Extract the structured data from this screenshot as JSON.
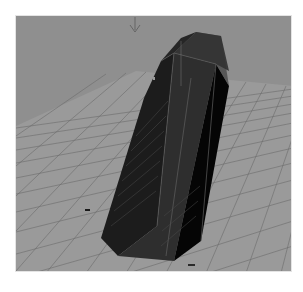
{
  "viewport": {
    "type": "3d-perspective-viewport",
    "background_color": "#8f8f8f",
    "grid_color": "#6a6a6a",
    "ground_color": "#9a9a9a",
    "object": {
      "name": "hexagonal-prism",
      "colors": {
        "face_left": "#1c1c1c",
        "face_front": "#2e2e2e",
        "face_right": "#050505",
        "top_cap": "#3a3a3a",
        "edge_highlight": "#6e6e6e"
      }
    },
    "manipulator_icon": "move-arrow-icon",
    "origin_marker": "axis-marker-icon",
    "bottom_label": "persp"
  }
}
